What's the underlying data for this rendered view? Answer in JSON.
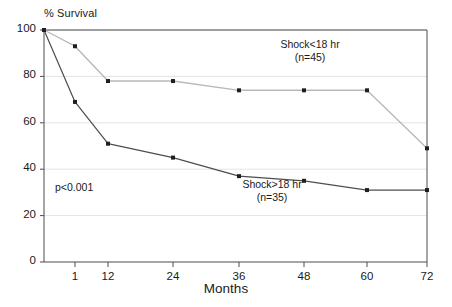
{
  "figure": {
    "background": "#ffffff",
    "frame_color": "#4d4d4d",
    "grid_color": "#e4e4e4"
  },
  "axes": {
    "y_title": "% Survival",
    "x_title": "Months",
    "y_ticks": [
      "0",
      "20",
      "40",
      "60",
      "80",
      "100"
    ],
    "x_ticks": [
      "1",
      "12",
      "24",
      "36",
      "48",
      "60",
      "72"
    ]
  },
  "annotations": {
    "upper_line1": "Shock<18 hr",
    "upper_line2": "(n=45)",
    "lower_line1": "Shock>18 hr",
    "lower_line2": "(n=35)",
    "pvalue": "p<0.001"
  },
  "chart_data": {
    "type": "line",
    "title": "",
    "subtitle": "",
    "xlabel": "Months",
    "ylabel": "% Survival",
    "ylim": [
      0,
      100
    ],
    "yticks": [
      0,
      20,
      40,
      60,
      80,
      100
    ],
    "x": [
      0,
      1,
      12,
      24,
      36,
      48,
      60,
      72
    ],
    "xtick_labels": [
      "1",
      "12",
      "24",
      "36",
      "48",
      "60",
      "72"
    ],
    "xtick_values": [
      1,
      12,
      24,
      36,
      48,
      60,
      72
    ],
    "x_axis_scale": "categorical-uneven",
    "grid": "horizontal-faint",
    "legend": "inline-annotations",
    "markers": "filled-square",
    "series": [
      {
        "name": "Shock<18 hr",
        "n": 45,
        "color": "#b9b9b9",
        "values": [
          100,
          93,
          78,
          78,
          74,
          74,
          74,
          49
        ]
      },
      {
        "name": "Shock>18 hr",
        "n": 35,
        "color": "#4d4d4d",
        "values": [
          100,
          69,
          51,
          45,
          37,
          35,
          31,
          31
        ]
      }
    ],
    "statistics": {
      "p_value_label": "p<0.001"
    }
  }
}
